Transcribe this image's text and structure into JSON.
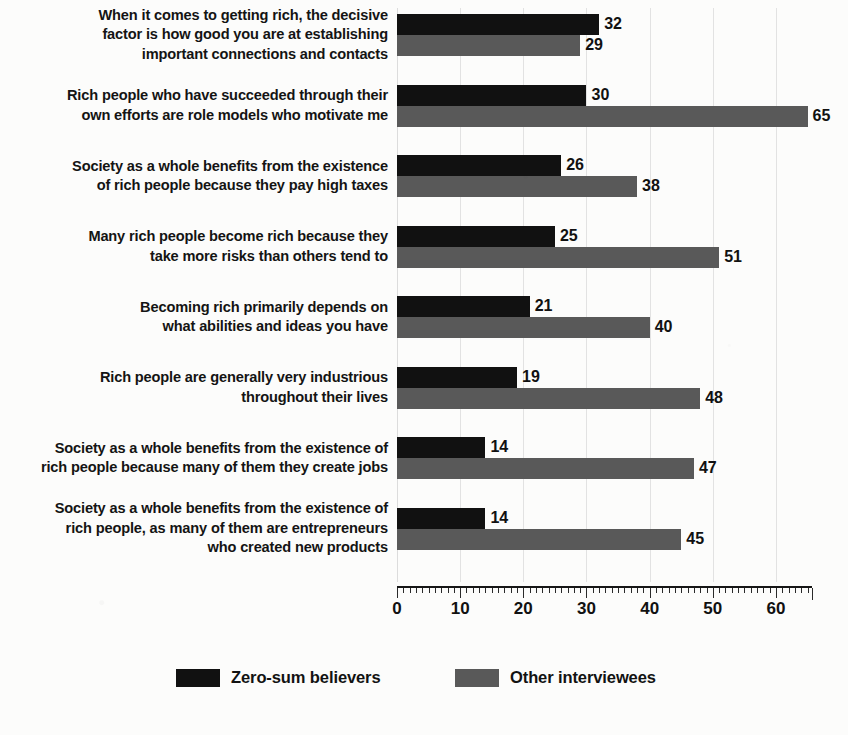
{
  "chart_data": {
    "type": "bar",
    "orientation": "horizontal",
    "title": "",
    "subtitle": "",
    "xlabel": "",
    "ylabel": "",
    "xlim": [
      0,
      65.7
    ],
    "xticks": [
      0,
      10,
      20,
      30,
      40,
      50,
      60
    ],
    "xtick_labels": [
      "0",
      "10",
      "20",
      "30",
      "40",
      "50",
      "60"
    ],
    "minor_tick_step": 1,
    "grid": true,
    "grid_axis": "x",
    "legend_position": "bottom",
    "categories": [
      "When it comes to getting rich, the decisive\nfactor is how good you are at establishing\nimportant connections and contacts",
      "Rich people who have succeeded through their\nown efforts are role models who motivate me",
      "Society as a whole benefits from the existence\nof rich people because they pay high taxes",
      "Many rich people become rich because they\ntake more risks than others tend to",
      "Becoming rich primarily depends on\nwhat abilities and ideas you have",
      "Rich people are generally very industrious\nthroughout their lives",
      "Society as a whole benefits from the existence of\nrich people because many of them they create jobs",
      "Society as a whole benefits from the existence of\nrich people, as many of them are entrepreneurs\nwho created new products"
    ],
    "series": [
      {
        "name": "Zero-sum believers",
        "color": "#111111",
        "values": [
          32,
          30,
          26,
          25,
          21,
          19,
          14,
          14
        ]
      },
      {
        "name": "Other interviewees",
        "color": "#595959",
        "values": [
          29,
          65,
          38,
          51,
          40,
          48,
          47,
          45
        ]
      }
    ]
  },
  "legend": {
    "items": [
      {
        "label": "Zero-sum believers",
        "color": "#111111"
      },
      {
        "label": "Other interviewees",
        "color": "#595959"
      }
    ]
  },
  "colors": {
    "background": "#fcfcfb",
    "text": "#141414",
    "gridline": "#e2e2e2",
    "axis": "#161616",
    "series_0": "#111111",
    "series_1": "#595959"
  }
}
